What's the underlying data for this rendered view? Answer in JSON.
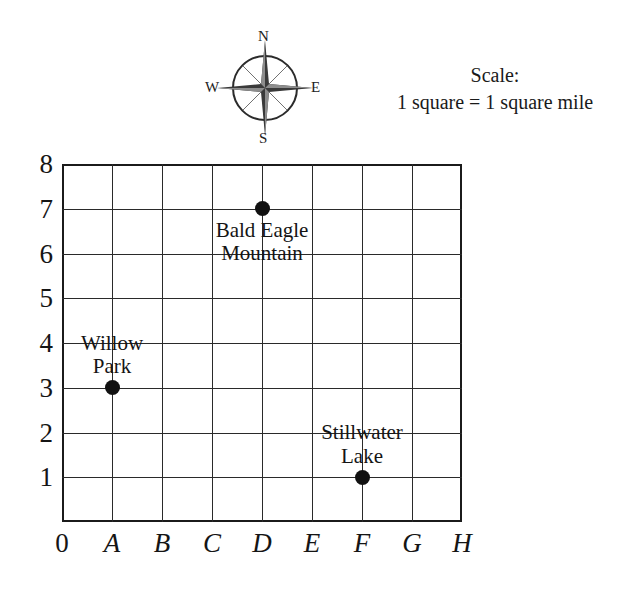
{
  "compass": {
    "north": "N",
    "south": "S",
    "west": "W",
    "east": "E"
  },
  "scale": {
    "title": "Scale:",
    "text": "1 square = 1 square mile"
  },
  "map": {
    "x_axis": {
      "origin": "0",
      "labels": [
        "A",
        "B",
        "C",
        "D",
        "E",
        "F",
        "G",
        "H"
      ]
    },
    "y_axis": {
      "labels": [
        "8",
        "7",
        "6",
        "5",
        "4",
        "3",
        "2",
        "1"
      ]
    },
    "grid": {
      "columns": 8,
      "rows": 8,
      "line_color": "#2a2a2a",
      "border_color": "#1b1b1b"
    },
    "places": [
      {
        "name": "Willow Park",
        "line1": "Willow",
        "line2": "Park",
        "coordinate": "A3",
        "x": "A",
        "y": "3",
        "marker_color": "#111111"
      },
      {
        "name": "Bald Eagle Mountain",
        "line1": "Bald Eagle",
        "line2": "Mountain",
        "coordinate": "D7",
        "x": "D",
        "y": "7",
        "marker_color": "#111111"
      },
      {
        "name": "Stillwater Lake",
        "line1": "Stillwater",
        "line2": "Lake",
        "coordinate": "F1",
        "x": "F",
        "y": "1",
        "marker_color": "#111111"
      }
    ]
  }
}
